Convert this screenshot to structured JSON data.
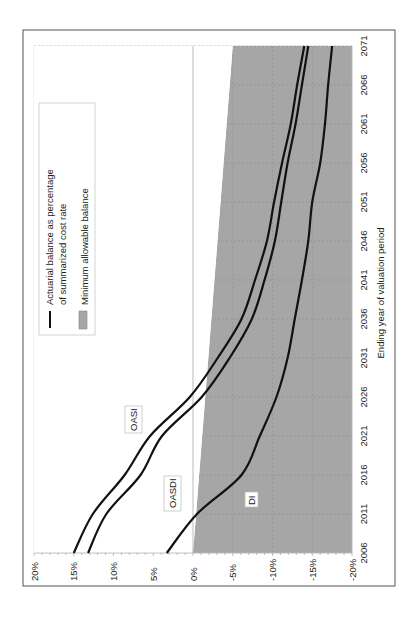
{
  "chart_data": {
    "type": "line",
    "orientation": "rotated 90 degrees counter-clockwise (x-axis runs bottom-to-top on screen)",
    "title": "",
    "xlabel": "Ending year of valuation period",
    "ylabel": "",
    "x_ticks": [
      "2006",
      "2011",
      "2016",
      "2021",
      "2026",
      "2031",
      "2036",
      "2041",
      "2046",
      "2051",
      "2056",
      "2061",
      "2066",
      "2071"
    ],
    "y_ticks": [
      "20%",
      "15%",
      "10%",
      "5%",
      "0%",
      "-5%",
      "-10%",
      "-15%",
      "-20%"
    ],
    "ylim": [
      -20,
      20
    ],
    "xlim": [
      2006,
      2071
    ],
    "grid": true,
    "x": [
      2006,
      2011,
      2016,
      2021,
      2026,
      2031,
      2036,
      2041,
      2046,
      2051,
      2056,
      2061,
      2066,
      2071
    ],
    "series": [
      {
        "name": "OASI",
        "values": [
          15.0,
          12.6,
          8.6,
          5.4,
          0.4,
          -3.1,
          -6.1,
          -7.8,
          -9.3,
          -10.2,
          -11.2,
          -12.3,
          -13.1,
          -14.0
        ]
      },
      {
        "name": "OASDI",
        "values": [
          13.2,
          10.9,
          6.6,
          3.9,
          -1.1,
          -4.6,
          -7.4,
          -9.0,
          -10.3,
          -11.1,
          -11.9,
          -12.9,
          -13.7,
          -14.5
        ]
      },
      {
        "name": "DI",
        "values": [
          3.3,
          -0.5,
          -6.1,
          -8.4,
          -10.5,
          -11.9,
          -12.8,
          -13.7,
          -14.5,
          -15.0,
          -16.0,
          -16.6,
          -17.0,
          -17.5
        ]
      }
    ],
    "minimum_allowable_balance": {
      "description": "Shaded area from linear threshold down to -20%",
      "start": {
        "year": 2006,
        "value": 0
      },
      "end": {
        "year": 2071,
        "value": -5
      }
    },
    "legend": [
      {
        "label_line1": "Actuarial balance as percentage",
        "label_line2": "of summarized cost rate",
        "symbol": "line"
      },
      {
        "label_line1": "Minimum allowable balance",
        "symbol": "shaded-box"
      }
    ],
    "legend_position": "upper-left (of rotated plot)",
    "annotations": [
      "OASI",
      "OASDI",
      "DI"
    ]
  },
  "colors": {
    "line": "#111111",
    "shade": "#a6a6a6",
    "grid": "#6e6e6e",
    "frame": "#555555"
  }
}
